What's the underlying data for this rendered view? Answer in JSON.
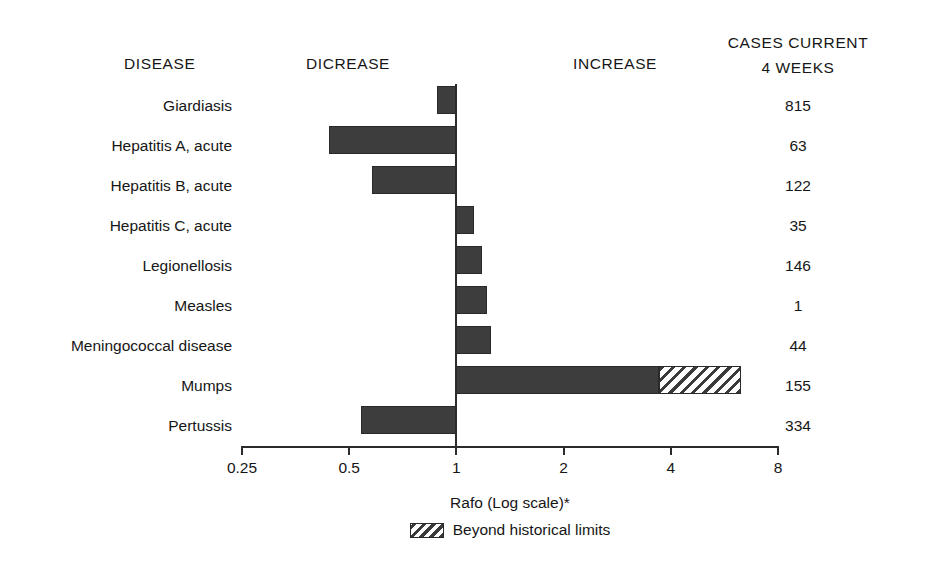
{
  "headers": {
    "disease": "DISEASE",
    "decrease": "DICREASE",
    "increase": "INCREASE",
    "cases_line1": "CASES CURRENT",
    "cases_line2": "4 WEEKS"
  },
  "axis_title": "Rafo (Log scale)*",
  "legend": {
    "hatch_label": "Beyond historical limits",
    "swatch_icon": "diagonal-hatch-swatch"
  },
  "colors": {
    "bar_solid": "#3d3d3d",
    "bar_outline": "#2a2a2a",
    "hatch_stroke": "#3a3a3a",
    "axis": "#2b2b2b",
    "text": "#161616",
    "background": "#ffffff"
  },
  "chart_data": {
    "type": "bar",
    "title": "",
    "orientation": "horizontal",
    "xlabel": "Rafo (Log scale)*",
    "ylabel": "DISEASE",
    "xscale": "log2",
    "xlim": [
      0.25,
      8
    ],
    "xticks": [
      0.25,
      0.5,
      1,
      2,
      4,
      8
    ],
    "xtick_labels": [
      "0.25",
      "0.5",
      "1",
      "2",
      "4",
      "8"
    ],
    "grid": false,
    "reference_line": 1,
    "legend_position": "below-axis",
    "legend_entries": [
      "Beyond historical limits"
    ],
    "categories": [
      "Giardiasis",
      "Hepatitis A, acute",
      "Hepatitis B, acute",
      "Hepatitis C, acute",
      "Legionellosis",
      "Measles",
      "Meningococcal disease",
      "Mumps",
      "Pertussis"
    ],
    "series": [
      {
        "name": "Ratio",
        "values": [
          0.88,
          0.44,
          0.58,
          1.12,
          1.18,
          1.22,
          1.25,
          3.7,
          0.54
        ]
      },
      {
        "name": "Beyond historical limits",
        "values": [
          null,
          null,
          null,
          null,
          null,
          null,
          null,
          6.3,
          null
        ]
      }
    ],
    "cases_current_4_weeks": [
      815,
      63,
      122,
      35,
      146,
      1,
      44,
      155,
      334
    ],
    "rows": [
      {
        "disease": "Giardiasis",
        "ratio": 0.88,
        "hatch_to": null,
        "cases": "815"
      },
      {
        "disease": "Hepatitis A, acute",
        "ratio": 0.44,
        "hatch_to": null,
        "cases": "63"
      },
      {
        "disease": "Hepatitis B, acute",
        "ratio": 0.58,
        "hatch_to": null,
        "cases": "122"
      },
      {
        "disease": "Hepatitis C, acute",
        "ratio": 1.12,
        "hatch_to": null,
        "cases": "35"
      },
      {
        "disease": "Legionellosis",
        "ratio": 1.18,
        "hatch_to": null,
        "cases": "146"
      },
      {
        "disease": "Measles",
        "ratio": 1.22,
        "hatch_to": null,
        "cases": "1"
      },
      {
        "disease": "Meningococcal disease",
        "ratio": 1.25,
        "hatch_to": null,
        "cases": "44"
      },
      {
        "disease": "Mumps",
        "ratio": 3.7,
        "hatch_to": 6.3,
        "cases": "155"
      },
      {
        "disease": "Pertussis",
        "ratio": 0.54,
        "hatch_to": null,
        "cases": "334"
      }
    ]
  }
}
